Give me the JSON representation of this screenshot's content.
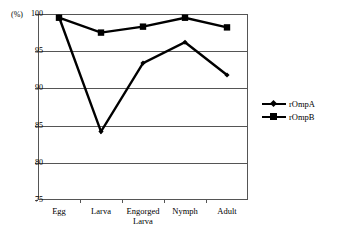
{
  "chart_data": {
    "type": "line",
    "title": "",
    "subtitle": "",
    "xlabel": "",
    "ylabel": "(%)",
    "categories": [
      "Egg",
      "Larva",
      "Engorged Larva",
      "Nymph",
      "Adult"
    ],
    "category_lines": [
      [
        "Egg"
      ],
      [
        "Larva"
      ],
      [
        "Engorged",
        "Larva"
      ],
      [
        "Nymph"
      ],
      [
        "Adult"
      ]
    ],
    "series": [
      {
        "name": "rOmpA",
        "marker": "diamond",
        "color": "#000000",
        "values": [
          99.6,
          84.2,
          93.4,
          96.2,
          91.8
        ]
      },
      {
        "name": "rOmpB",
        "marker": "square",
        "color": "#000000",
        "values": [
          99.5,
          97.5,
          98.3,
          99.5,
          98.2
        ]
      }
    ],
    "ylim": [
      75,
      100
    ],
    "yticks": [
      100,
      95,
      90,
      85,
      80,
      75
    ],
    "ytick_labels": [
      "100",
      "95",
      "90",
      "85",
      "80",
      "75"
    ],
    "grid": true,
    "grid_axis": "y",
    "legend_position": "right",
    "legend_entries": [
      "rOmpA",
      "rOmpB"
    ],
    "axis_color": "#555555",
    "line_color": "#000000",
    "background": "#ffffff"
  }
}
